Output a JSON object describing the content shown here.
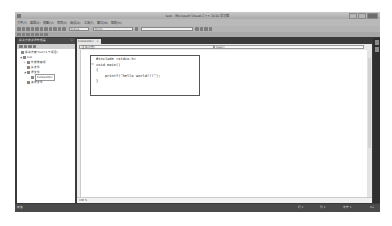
{
  "window": {
    "title": "test - Microsoft Visual C++ 2010 学习版",
    "controls": [
      "minimize",
      "maximize",
      "close"
    ]
  },
  "menu": [
    "文件(F)",
    "编辑(E)",
    "视图(V)",
    "项目(P)",
    "调试(D)",
    "工具(T)",
    "窗口(W)",
    "帮助(H)"
  ],
  "toolbar": {
    "config_combo": "Debug",
    "platform_combo": "Win32",
    "find_combo": ""
  },
  "solution_explorer": {
    "header": "解决方案资源管理器",
    "close_glyph": "×",
    "tree": [
      {
        "label": "解决方案\"test\"(1 个项目)",
        "level": 0,
        "icon": "solution-icon",
        "toggle": ""
      },
      {
        "label": "test",
        "level": 1,
        "icon": "project-icon",
        "toggle": "◢"
      },
      {
        "label": "外部依赖项",
        "level": 2,
        "icon": "folder-icon",
        "toggle": "▷"
      },
      {
        "label": "头文件",
        "level": 2,
        "icon": "folder-icon",
        "toggle": ""
      },
      {
        "label": "源文件",
        "level": 2,
        "icon": "folder-icon",
        "toggle": "◢"
      },
      {
        "label": "helloworld.c",
        "level": 3,
        "icon": "c-file-icon",
        "toggle": ""
      },
      {
        "label": "资源文件",
        "level": 2,
        "icon": "folder-icon",
        "toggle": ""
      }
    ]
  },
  "editor": {
    "tab_label": "helloworld.c",
    "tab_close": "×",
    "nav_left": "(全局范围)",
    "nav_right": "main()",
    "code_lines": [
      "#include <stdio.h>",
      "void main()",
      "{",
      "    printf(\"hello world!!!\");",
      "}"
    ],
    "fold_marker": "⊟",
    "zoom_level": "100 %"
  },
  "status_bar": {
    "ready": "就绪",
    "line": "行 1",
    "col": "列 1",
    "char": "字符 1",
    "mode": "Ins"
  }
}
